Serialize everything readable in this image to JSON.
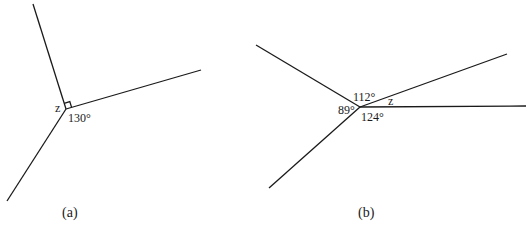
{
  "figures": [
    {
      "caption": "(a)",
      "vertex": [
        66,
        109
      ],
      "rays": [
        [
          33,
          4
        ],
        [
          201,
          70
        ],
        [
          7,
          201
        ]
      ],
      "labels": {
        "unknown": "z",
        "angle1": "130°"
      },
      "right_angle_marker": true
    },
    {
      "caption": "(b)",
      "vertex": [
        360,
        107
      ],
      "rays": [
        [
          256,
          45
        ],
        [
          507,
          54
        ],
        [
          526,
          106
        ],
        [
          269,
          188
        ]
      ],
      "labels": {
        "angle_top": "112°",
        "angle_left": "89°",
        "angle_bottom": "124°",
        "unknown": "z"
      }
    }
  ],
  "colors": {
    "line": "#1a1a1a",
    "background": "#ffffff"
  }
}
